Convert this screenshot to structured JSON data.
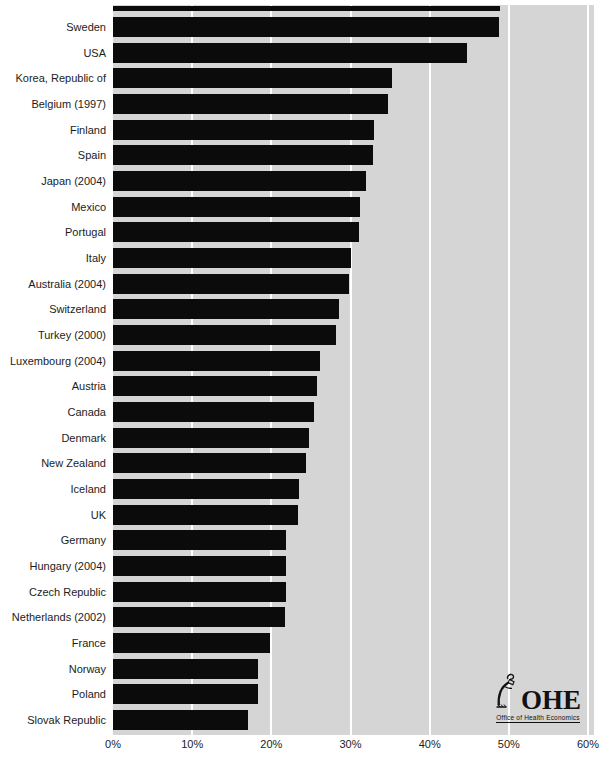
{
  "chart_data": {
    "type": "bar",
    "orientation": "horizontal",
    "title": "",
    "xlabel": "",
    "ylabel": "",
    "xlim": [
      0,
      60
    ],
    "x_ticks": [
      {
        "label": "0%",
        "value": 0
      },
      {
        "label": "10%",
        "value": 10
      },
      {
        "label": "20%",
        "value": 20
      },
      {
        "label": "30%",
        "value": 30
      },
      {
        "label": "40%",
        "value": 40
      },
      {
        "label": "50%",
        "value": 50
      },
      {
        "label": "60%",
        "value": 60
      }
    ],
    "grid": "vertical white gridlines every 10%",
    "legend": "none",
    "categories": [
      "Sweden",
      "USA",
      "Korea, Republic of",
      "Belgium (1997)",
      "Finland",
      "Spain",
      "Japan (2004)",
      "Mexico",
      "Portugal",
      "Italy",
      "Australia (2004)",
      "Switzerland",
      "Turkey (2000)",
      "Luxembourg (2004)",
      "Austria",
      "Canada",
      "Denmark",
      "New Zealand",
      "Iceland",
      "UK",
      "Germany",
      "Hungary (2004)",
      "Czech Republic",
      "Netherlands (2002)",
      "France",
      "Norway",
      "Poland",
      "Slovak Republic"
    ],
    "values": [
      48.8,
      44.7,
      35.2,
      34.7,
      33.0,
      32.9,
      31.9,
      31.2,
      31.1,
      30.1,
      29.8,
      28.5,
      28.2,
      26.2,
      25.8,
      25.4,
      24.8,
      24.4,
      23.5,
      23.4,
      21.9,
      21.8,
      21.8,
      21.7,
      19.8,
      18.3,
      18.3,
      17.0
    ],
    "partial_top_bar_value": 48.9,
    "colors": {
      "bar": "#0b0b0b",
      "plot_background": "#d5d5d5",
      "page_background": "#ffffff",
      "gridline": "#ffffff",
      "text": "#1c1c1c"
    }
  },
  "logo": {
    "acronym": "OHE",
    "caption": "Office of Health Economics",
    "icon": "lamplighter-icon"
  }
}
